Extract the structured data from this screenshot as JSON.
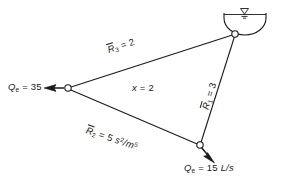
{
  "figure": {
    "stroke_color": "#1a1a1a",
    "background_color": "#ffffff"
  },
  "nodes": [
    {
      "id": "junction-left",
      "name": "left-junction-node",
      "x": 68,
      "y": 88,
      "style": "open-circle"
    },
    {
      "id": "junction-top",
      "name": "reservoir-outlet-node",
      "x": 235,
      "y": 34,
      "style": "open-circle"
    },
    {
      "id": "junction-bottom",
      "name": "bottom-junction-node",
      "x": 200,
      "y": 145,
      "style": "open-circle"
    }
  ],
  "reservoir": {
    "label": "reservoir",
    "water_surface_symbol": "inverted-triangle"
  },
  "labels": {
    "q_left": {
      "symbol": "Q",
      "subscript": "e",
      "equals": " = ",
      "value": "35"
    },
    "q_bottom": {
      "symbol": "Q",
      "subscript": "e",
      "equals": " = ",
      "value": "15",
      "units": "L/s"
    },
    "r1": {
      "symbol": "R",
      "subscript": "1",
      "equals": " = ",
      "value": "3"
    },
    "r2": {
      "symbol": "R",
      "subscript": "2",
      "equals": " = ",
      "value": "5",
      "units_base": "s",
      "units_sup1": "2",
      "units_div": "/m",
      "units_sup2": "5"
    },
    "r3": {
      "symbol": "R",
      "subscript": "3",
      "equals": " = ",
      "value": "2"
    },
    "x": {
      "symbol": "x",
      "equals": " = ",
      "value": "2"
    }
  },
  "arrows": [
    {
      "name": "outflow-arrow-left",
      "direction": "left",
      "from_node": "junction-left"
    },
    {
      "name": "outflow-arrow-bottom",
      "direction": "down-right",
      "from_node": "junction-bottom"
    }
  ],
  "edges": [
    {
      "name": "pipe-r3",
      "from": "junction-left",
      "to": "junction-top"
    },
    {
      "name": "pipe-r1",
      "from": "junction-top",
      "to": "junction-bottom"
    },
    {
      "name": "pipe-r2",
      "from": "junction-bottom",
      "to": "junction-left"
    }
  ]
}
